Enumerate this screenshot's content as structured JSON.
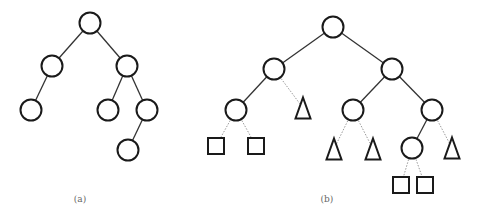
{
  "figure": {
    "panels": [
      {
        "id": "a",
        "caption": "(a)",
        "caption_pos": [
          80,
          194
        ],
        "nodes": [
          {
            "id": "a0",
            "type": "circle",
            "x": 90,
            "y": 23
          },
          {
            "id": "a1",
            "type": "circle",
            "x": 52,
            "y": 66
          },
          {
            "id": "a2",
            "type": "circle",
            "x": 127,
            "y": 66
          },
          {
            "id": "a3",
            "type": "circle",
            "x": 31,
            "y": 110
          },
          {
            "id": "a4",
            "type": "circle",
            "x": 108,
            "y": 110
          },
          {
            "id": "a5",
            "type": "circle",
            "x": 147,
            "y": 110
          },
          {
            "id": "a6",
            "type": "circle",
            "x": 128,
            "y": 150
          }
        ],
        "edges": [
          {
            "from": "a0",
            "to": "a1",
            "style": "solid"
          },
          {
            "from": "a0",
            "to": "a2",
            "style": "solid"
          },
          {
            "from": "a1",
            "to": "a3",
            "style": "solid"
          },
          {
            "from": "a2",
            "to": "a4",
            "style": "solid"
          },
          {
            "from": "a2",
            "to": "a5",
            "style": "solid"
          },
          {
            "from": "a5",
            "to": "a6",
            "style": "solid"
          }
        ]
      },
      {
        "id": "b",
        "caption": "(b)",
        "caption_pos": [
          327,
          194
        ],
        "nodes": [
          {
            "id": "b0",
            "type": "circle",
            "x": 333,
            "y": 27
          },
          {
            "id": "b1",
            "type": "circle",
            "x": 274,
            "y": 69
          },
          {
            "id": "b2",
            "type": "circle",
            "x": 392,
            "y": 69
          },
          {
            "id": "b3",
            "type": "circle",
            "x": 236,
            "y": 110
          },
          {
            "id": "b4",
            "type": "triangle",
            "x": 303,
            "y": 108
          },
          {
            "id": "b5",
            "type": "circle",
            "x": 353,
            "y": 110
          },
          {
            "id": "b6",
            "type": "circle",
            "x": 432,
            "y": 110
          },
          {
            "id": "b7",
            "type": "square",
            "x": 216,
            "y": 146
          },
          {
            "id": "b8",
            "type": "square",
            "x": 256,
            "y": 146
          },
          {
            "id": "b9",
            "type": "triangle",
            "x": 334,
            "y": 149
          },
          {
            "id": "b10",
            "type": "triangle",
            "x": 373,
            "y": 149
          },
          {
            "id": "b11",
            "type": "circle",
            "x": 412,
            "y": 148
          },
          {
            "id": "b12",
            "type": "triangle",
            "x": 452,
            "y": 148
          },
          {
            "id": "b13",
            "type": "square",
            "x": 401,
            "y": 185
          },
          {
            "id": "b14",
            "type": "square",
            "x": 425,
            "y": 185
          }
        ],
        "edges": [
          {
            "from": "b0",
            "to": "b1",
            "style": "solid"
          },
          {
            "from": "b0",
            "to": "b2",
            "style": "solid"
          },
          {
            "from": "b1",
            "to": "b3",
            "style": "solid"
          },
          {
            "from": "b1",
            "to": "b4",
            "style": "dotted"
          },
          {
            "from": "b2",
            "to": "b5",
            "style": "solid"
          },
          {
            "from": "b2",
            "to": "b6",
            "style": "solid"
          },
          {
            "from": "b3",
            "to": "b7",
            "style": "dotted"
          },
          {
            "from": "b3",
            "to": "b8",
            "style": "dotted"
          },
          {
            "from": "b5",
            "to": "b9",
            "style": "dotted"
          },
          {
            "from": "b5",
            "to": "b10",
            "style": "dotted"
          },
          {
            "from": "b6",
            "to": "b11",
            "style": "solid"
          },
          {
            "from": "b6",
            "to": "b12",
            "style": "dotted"
          },
          {
            "from": "b11",
            "to": "b13",
            "style": "dotted"
          },
          {
            "from": "b11",
            "to": "b14",
            "style": "dotted"
          }
        ]
      }
    ],
    "sizes": {
      "circle_r": 10.5,
      "square": 16,
      "triangle_w": 15,
      "triangle_h": 21
    }
  }
}
